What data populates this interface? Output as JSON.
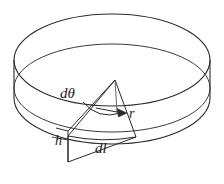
{
  "figure": {
    "background_color": "#ffffff",
    "stroke_color": "#2b2b2b",
    "labels": {
      "angle": "dθ",
      "radius": "r",
      "height": "h",
      "arc_length": "dl"
    },
    "elements": {
      "top_rim_ellipse": "outer top ellipse of the disk",
      "inner_ellipse": "inner/lower ellipse forming the disk top surface edge",
      "bottom_arc": "front bottom arc of the cylinder wall",
      "left_wall_edge": "left vertical side of cylinder wall",
      "right_wall_edge": "right vertical side of cylinder wall",
      "sector_wedge": "triangular sector element from center to rim",
      "radius_arrow": "arrow along radius direction labelled r",
      "angle_arc": "arc subtending the differential angle dθ",
      "height_segment": "vertical segment marking thickness h"
    }
  }
}
